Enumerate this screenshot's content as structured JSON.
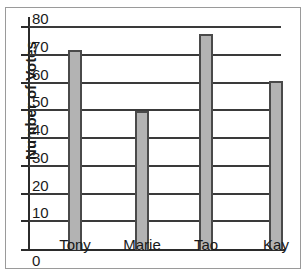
{
  "chart_data": {
    "type": "bar",
    "title": "",
    "xlabel": "",
    "ylabel": "Number of Votes",
    "categories": [
      "Tony",
      "Marie",
      "Tao",
      "Kay"
    ],
    "values": [
      72,
      50,
      78,
      61
    ],
    "ylim": [
      0,
      84
    ],
    "yticks": [
      10,
      20,
      30,
      40,
      50,
      60,
      70,
      80
    ],
    "ytick_labels": [
      "10",
      "20",
      "30",
      "40",
      "50",
      "60",
      "70",
      "80"
    ],
    "origin_label": "0",
    "grid": true,
    "legend": false,
    "bar_color": "#b3b3b3",
    "bar_border_color": "#4a4a4a",
    "axis_color": "#2b2b2b",
    "gridline_color": "#3a3a3a",
    "background_color": "#ffffff",
    "frame_color": "#9a9a9a"
  }
}
